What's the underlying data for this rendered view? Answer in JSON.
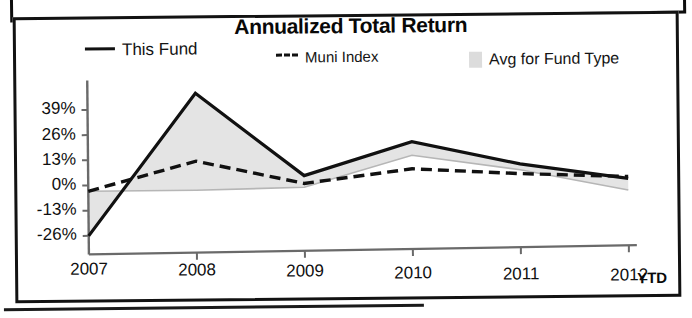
{
  "document": {
    "frames": 2
  },
  "chart": {
    "title": "Annualized Total Return",
    "legend": [
      {
        "label": "This Fund",
        "marker": "solid-line-swatch"
      },
      {
        "label": "Muni Index",
        "marker": "dashed-line-swatch"
      },
      {
        "label": "Avg for Fund Type",
        "marker": "area-swatch"
      }
    ],
    "axis_suffix_label": "YTD"
  },
  "chart_data": {
    "type": "line",
    "title": "Annualized Total Return",
    "xlabel": "",
    "ylabel": "",
    "categories": [
      "2007",
      "2008",
      "2009",
      "2010",
      "2011",
      "2012"
    ],
    "ytick_labels": [
      "39%",
      "26%",
      "13%",
      "0%",
      "-13%",
      "-26%"
    ],
    "yticks": [
      39,
      26,
      13,
      0,
      -13,
      -26
    ],
    "ylim": [
      -26,
      52
    ],
    "grid": false,
    "legend_position": "top",
    "series": [
      {
        "name": "This Fund",
        "style": "solid",
        "color": "#111111",
        "values": [
          -26,
          47,
          4,
          21,
          9,
          1
        ]
      },
      {
        "name": "Muni Index",
        "style": "dashed",
        "color": "#111111",
        "values": [
          -3,
          12,
          0,
          7,
          4,
          2
        ]
      },
      {
        "name": "Avg for Fund Type",
        "style": "area",
        "color": "#dcdcdc",
        "values": [
          -3,
          -3,
          -2,
          14,
          6,
          -5
        ]
      }
    ],
    "annotations": [
      "YTD"
    ]
  },
  "colors": {
    "line": "#111111",
    "area_fill": "#e4e4e4",
    "axis": "#6a6a6a",
    "frame": "#101010"
  }
}
